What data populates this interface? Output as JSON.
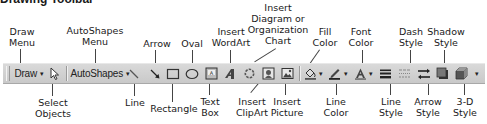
{
  "title": "Drawing Toolbar",
  "toolbar": {
    "draw_menu": "Draw",
    "autoshapes_menu": "AutoShapes",
    "dropdown_caret": "▾",
    "background_color": "#cfcfcf"
  },
  "labels": {
    "draw_menu": "Draw\nMenu",
    "autoshapes_menu": "AutoShapes\nMenu",
    "arrow": "Arrow",
    "oval": "Oval",
    "insert_wordart": "Insert\nWordArt",
    "insert_diagram": "Insert\nDiagram or\nOrganization\nChart",
    "fill_color": "Fill\nColor",
    "font_color": "Font\nColor",
    "dash_style": "Dash\nStyle",
    "shadow_style": "Shadow\nStyle",
    "select_objects": "Select\nObjects",
    "line": "Line",
    "rectangle": "Rectangle",
    "text_box": "Text\nBox",
    "insert_clipart": "Insert\nClipArt",
    "insert_picture": "Insert\nPicture",
    "line_color": "Line\nColor",
    "line_style": "Line\nStyle",
    "arrow_style": "Arrow\nStyle",
    "3d_style": "3-D\nStyle"
  }
}
